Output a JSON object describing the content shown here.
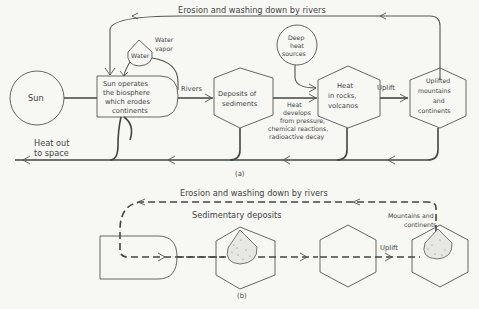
{
  "diagram_a": {
    "caption": "(a)",
    "top_flow_label": "Erosion and washing down by rivers",
    "nodes": {
      "sun": "Sun",
      "biosphere": [
        "Sun operates",
        "the biosphere",
        "which erodes",
        "continents"
      ],
      "water": "Water",
      "water_vapor": [
        "Water",
        "vapor"
      ],
      "deposits": [
        "Deposits of",
        "sediments"
      ],
      "deep_heat": [
        "Deep",
        "heat",
        "sources"
      ],
      "heat_rocks": [
        "Heat",
        "in rocks,",
        "volcanos"
      ],
      "uplifted": [
        "Uplifted",
        "mountains",
        "and",
        "continents"
      ]
    },
    "edge_labels": {
      "rivers": "Rivers",
      "uplift": "Uplift",
      "heat_develops": [
        "Heat",
        "develops",
        "from pressure,",
        "chemical reactions,",
        "radioactive decay"
      ],
      "heat_out": [
        "Heat out",
        "to space"
      ]
    }
  },
  "diagram_b": {
    "caption": "(b)",
    "top_flow_label": "Erosion and washing down by rivers",
    "sedimentary_label": "Sedimentary deposits",
    "mountains_label": [
      "Mountains and",
      "continents"
    ],
    "uplift_label": "Uplift"
  }
}
